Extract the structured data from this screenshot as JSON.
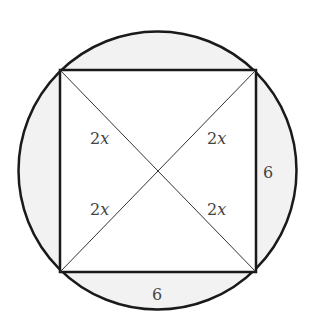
{
  "diagram": {
    "colors": {
      "stroke": "#1a1a1a",
      "segment_fill": "#f2f2f2",
      "square_fill": "#ffffff",
      "label": "#444444"
    },
    "labels": {
      "diag_top_left": {
        "num": "2",
        "var": "x"
      },
      "diag_top_right": {
        "num": "2",
        "var": "x"
      },
      "diag_bottom_left": {
        "num": "2",
        "var": "x"
      },
      "diag_bottom_right": {
        "num": "2",
        "var": "x"
      },
      "side_right": "6",
      "side_bottom": "6"
    }
  }
}
